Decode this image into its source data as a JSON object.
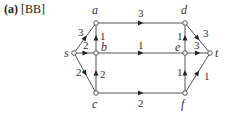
{
  "panel": {
    "tag": "(a)",
    "ref": "[BB]"
  },
  "nodes": [
    {
      "id": "s",
      "x": 74,
      "y": 53,
      "lx": 64,
      "ly": 57
    },
    {
      "id": "a",
      "x": 96,
      "y": 23,
      "lx": 92,
      "ly": 14
    },
    {
      "id": "b",
      "x": 96,
      "y": 53,
      "lx": 101,
      "ly": 51
    },
    {
      "id": "c",
      "x": 96,
      "y": 93,
      "lx": 92,
      "ly": 108
    },
    {
      "id": "d",
      "x": 185,
      "y": 23,
      "lx": 181,
      "ly": 14
    },
    {
      "id": "e",
      "x": 185,
      "y": 53,
      "lx": 175,
      "ly": 51
    },
    {
      "id": "f",
      "x": 185,
      "y": 93,
      "lx": 181,
      "ly": 108
    },
    {
      "id": "t",
      "x": 210,
      "y": 53,
      "lx": 215,
      "ly": 57
    }
  ],
  "edges": [
    {
      "from": "s",
      "to": "a",
      "weight": "3",
      "wx": 78,
      "wy": 36
    },
    {
      "from": "s",
      "to": "b",
      "weight": "2",
      "wx": 83,
      "wy": 49
    },
    {
      "from": "s",
      "to": "c",
      "weight": "2",
      "wx": 76,
      "wy": 76
    },
    {
      "from": "b",
      "to": "a",
      "weight": "1",
      "wx": 100,
      "wy": 40
    },
    {
      "from": "c",
      "to": "b",
      "weight": "2",
      "wx": 100,
      "wy": 78
    },
    {
      "from": "a",
      "to": "d",
      "weight": "3",
      "wx": 138,
      "wy": 17
    },
    {
      "from": "b",
      "to": "e",
      "weight": "1",
      "wx": 138,
      "wy": 49
    },
    {
      "from": "c",
      "to": "f",
      "weight": "2",
      "wx": 138,
      "wy": 107
    },
    {
      "from": "e",
      "to": "d",
      "weight": "1",
      "wx": 177,
      "wy": 40
    },
    {
      "from": "d",
      "to": "t",
      "weight": "3",
      "wx": 203,
      "wy": 37
    },
    {
      "from": "e",
      "to": "t",
      "weight": "3",
      "wx": 194,
      "wy": 49
    },
    {
      "from": "f",
      "to": "e",
      "weight": "1",
      "wx": 177,
      "wy": 76
    },
    {
      "from": "f",
      "to": "t",
      "weight": "1",
      "wx": 204,
      "wy": 80
    }
  ]
}
